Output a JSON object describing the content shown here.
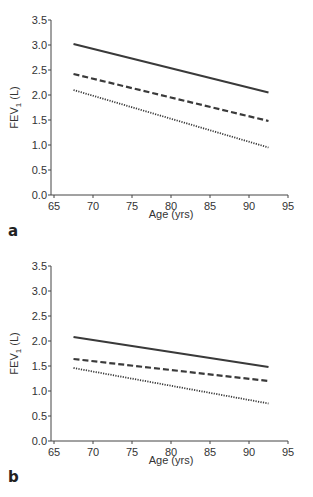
{
  "chart_data": [
    {
      "panel": "a",
      "type": "line",
      "title": "",
      "xlabel": "Age (yrs)",
      "ylabel_main": "FEV",
      "ylabel_sub": "1",
      "ylabel_unit": " (L)",
      "xlim": [
        65,
        95
      ],
      "ylim": [
        0,
        3.5
      ],
      "xticks": [
        65,
        70,
        75,
        80,
        85,
        90,
        95
      ],
      "yticks": [
        "0.0",
        "0.5",
        "1.0",
        "1.5",
        "2.0",
        "2.5",
        "3.0",
        "3.5"
      ],
      "grid": false,
      "series": [
        {
          "name": "solid",
          "style": "solid",
          "x": [
            67.5,
            92.5
          ],
          "y": [
            3.02,
            2.05
          ]
        },
        {
          "name": "dashed",
          "style": "dashed",
          "x": [
            67.5,
            92.5
          ],
          "y": [
            2.42,
            1.48
          ]
        },
        {
          "name": "dotted",
          "style": "dotted",
          "x": [
            67.5,
            92.5
          ],
          "y": [
            2.1,
            0.95
          ]
        }
      ]
    },
    {
      "panel": "b",
      "type": "line",
      "title": "",
      "xlabel": "Age (yrs)",
      "ylabel_main": "FEV",
      "ylabel_sub": "1",
      "ylabel_unit": " (L)",
      "xlim": [
        65,
        95
      ],
      "ylim": [
        0,
        3.5
      ],
      "xticks": [
        65,
        70,
        75,
        80,
        85,
        90,
        95
      ],
      "yticks": [
        "0.0",
        "0.5",
        "1.0",
        "1.5",
        "2.0",
        "2.5",
        "3.0",
        "3.5"
      ],
      "grid": false,
      "series": [
        {
          "name": "solid",
          "style": "solid",
          "x": [
            67.5,
            92.5
          ],
          "y": [
            2.08,
            1.48
          ]
        },
        {
          "name": "dashed",
          "style": "dashed",
          "x": [
            67.5,
            92.5
          ],
          "y": [
            1.64,
            1.2
          ]
        },
        {
          "name": "dotted",
          "style": "dotted",
          "x": [
            67.5,
            92.5
          ],
          "y": [
            1.46,
            0.75
          ]
        }
      ]
    }
  ],
  "colors": {
    "line": "#3a3a3a",
    "axis": "#444444"
  }
}
